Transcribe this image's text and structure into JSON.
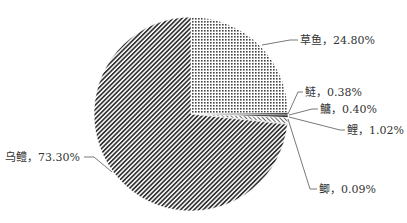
{
  "chart_data": {
    "type": "pie",
    "title": "",
    "start_angle": "12 o'clock, clockwise",
    "slices": [
      {
        "name": "草鱼",
        "value": 24.8,
        "label": "草鱼，24.80%",
        "pattern": "dots"
      },
      {
        "name": "鲢",
        "value": 0.38,
        "label": "鲢，0.38%",
        "pattern": "dark"
      },
      {
        "name": "鳙",
        "value": 0.4,
        "label": "鳙，0.40%",
        "pattern": "dark"
      },
      {
        "name": "鲤",
        "value": 1.02,
        "label": "鲤，1.02%",
        "pattern": "light-hatch"
      },
      {
        "name": "鲫",
        "value": 0.09,
        "label": "鲫，0.09%",
        "pattern": "dark"
      },
      {
        "name": "乌鳢",
        "value": 73.3,
        "label": "乌鳢，73.30%",
        "pattern": "diagonal-hatch"
      }
    ],
    "legend": "none (labels with leader lines)",
    "colors": {
      "ink": "#333333",
      "background": "#ffffff"
    }
  }
}
